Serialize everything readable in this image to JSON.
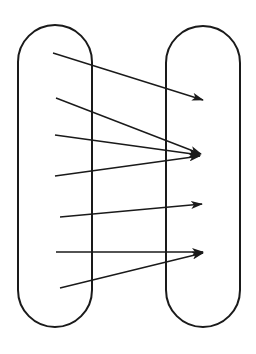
{
  "diagram": {
    "type": "mapping-diagram",
    "colors": {
      "stroke": "#1a1a1a",
      "background": "#ffffff"
    },
    "sets": [
      {
        "name": "domain",
        "x": 18,
        "y": 25,
        "width": 74,
        "height": 302
      },
      {
        "name": "codomain",
        "x": 166,
        "y": 26,
        "width": 74,
        "height": 301
      }
    ],
    "arrows": [
      {
        "from": [
          53,
          53
        ],
        "to": [
          203,
          100
        ]
      },
      {
        "from": [
          56,
          98
        ],
        "to": [
          201,
          154
        ]
      },
      {
        "from": [
          55,
          135
        ],
        "to": [
          200,
          155
        ]
      },
      {
        "from": [
          55,
          176
        ],
        "to": [
          200,
          156
        ]
      },
      {
        "from": [
          60,
          217
        ],
        "to": [
          202,
          204
        ]
      },
      {
        "from": [
          56,
          252
        ],
        "to": [
          203,
          252
        ]
      },
      {
        "from": [
          60,
          288
        ],
        "to": [
          203,
          253
        ]
      }
    ]
  }
}
